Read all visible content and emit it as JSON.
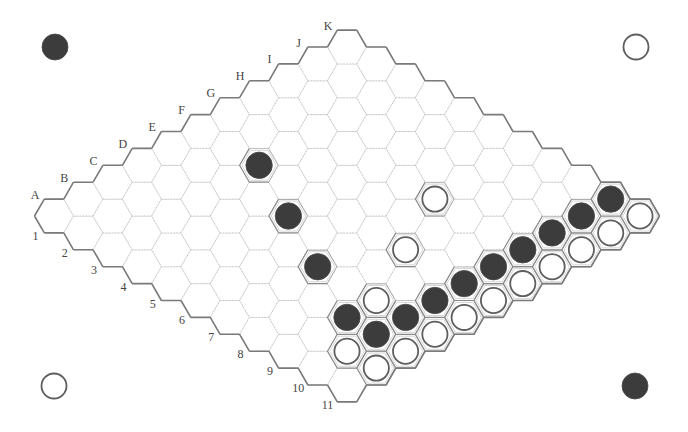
{
  "game": "Hex",
  "board": {
    "size": 11,
    "row_labels": [
      "A",
      "B",
      "C",
      "D",
      "E",
      "F",
      "G",
      "H",
      "I",
      "J",
      "K"
    ],
    "col_labels": [
      "1",
      "2",
      "3",
      "4",
      "5",
      "6",
      "7",
      "8",
      "9",
      "10",
      "11"
    ],
    "origin": [
      54,
      216
    ],
    "step_x": 29.3,
    "step_y": 16.9,
    "hex_radius": 19.5
  },
  "stones": {
    "black": [
      "F3",
      "E5",
      "D7",
      "C9",
      "C10",
      "D10",
      "E10",
      "F10",
      "G10",
      "H10",
      "I10",
      "J10",
      "K10"
    ],
    "white": [
      "H7",
      "F8",
      "D9",
      "B10",
      "B11",
      "C11",
      "D11",
      "E11",
      "F11",
      "G11",
      "H11",
      "I11",
      "J11",
      "K11"
    ]
  },
  "corner_markers": [
    {
      "position": "top-left",
      "color": "black",
      "x": 55,
      "y": 47
    },
    {
      "position": "top-right",
      "color": "white",
      "x": 636,
      "y": 47
    },
    {
      "position": "bottom-left",
      "color": "white",
      "x": 54,
      "y": 386
    },
    {
      "position": "bottom-right",
      "color": "black",
      "x": 635,
      "y": 386
    }
  ],
  "colors": {
    "black_stone": "#3c3c3c",
    "white_stone_ring": "#5e5e5e",
    "border": "#7a7a7a",
    "grid": "#bdbdbd"
  }
}
